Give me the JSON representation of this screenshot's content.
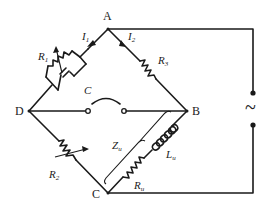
{
  "diagram": {
    "type": "AC bridge circuit (Maxwell-type inductance bridge)",
    "nodes": {
      "A": "A",
      "B": "B",
      "C": "C",
      "D": "D"
    },
    "labels": {
      "i1": "I",
      "i1_sub": "1",
      "i2": "I",
      "i2_sub": "2",
      "r1": "R",
      "r1_sub": "1",
      "r2": "R",
      "r2_sub": "2",
      "r3": "R",
      "r3_sub": "3",
      "c": "C",
      "zu": "Z",
      "zu_sub": "u",
      "lu": "L",
      "lu_sub": "u",
      "ru": "R",
      "ru_sub": "u",
      "source": "~"
    },
    "branches": [
      {
        "from": "A",
        "to": "D",
        "elements": [
          "R1 (variable)",
          "C (parallel)"
        ],
        "current": "I1"
      },
      {
        "from": "A",
        "to": "B",
        "elements": [
          "R3"
        ],
        "current": "I2"
      },
      {
        "from": "D",
        "to": "C",
        "elements": [
          "R2 (variable)"
        ]
      },
      {
        "from": "B",
        "to": "C",
        "elements": [
          "Lu",
          "Ru"
        ],
        "impedance": "Zu"
      },
      {
        "from": "D",
        "to": "B",
        "elements": [
          "detector (headphone)"
        ]
      },
      {
        "from": "A",
        "to": "C",
        "elements": [
          "AC source ~"
        ]
      }
    ]
  }
}
